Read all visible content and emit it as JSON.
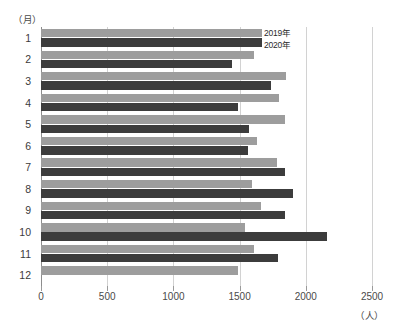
{
  "chart_data": {
    "type": "bar",
    "orientation": "horizontal",
    "title": "",
    "xlabel": "（人）",
    "ylabel": "（月）",
    "categories": [
      "1",
      "2",
      "3",
      "4",
      "5",
      "6",
      "7",
      "8",
      "9",
      "10",
      "11",
      "12"
    ],
    "series": [
      {
        "name": "2019年",
        "color": "#9d9d9d",
        "values": [
          1670,
          1610,
          1850,
          1800,
          1840,
          1630,
          1780,
          1590,
          1660,
          1540,
          1610,
          1490
        ]
      },
      {
        "name": "2020年",
        "color": "#3c3c3c",
        "values": [
          1670,
          1440,
          1740,
          1490,
          1570,
          1560,
          1840,
          1900,
          1840,
          2160,
          1790,
          null
        ]
      }
    ],
    "xlim": [
      0,
      2500
    ],
    "xticks": [
      0,
      500,
      1000,
      1500,
      2000,
      2500
    ],
    "xtick_labels": [
      "0",
      "500",
      "1000",
      "1500",
      "2000",
      "2500"
    ],
    "grid": "vertical",
    "legend_position": "inside-top-right"
  },
  "axes": {
    "y_unit": "（月）",
    "x_unit": "（人）"
  },
  "legend": {
    "items": [
      {
        "label": "2019年"
      },
      {
        "label": "2020年"
      }
    ]
  }
}
